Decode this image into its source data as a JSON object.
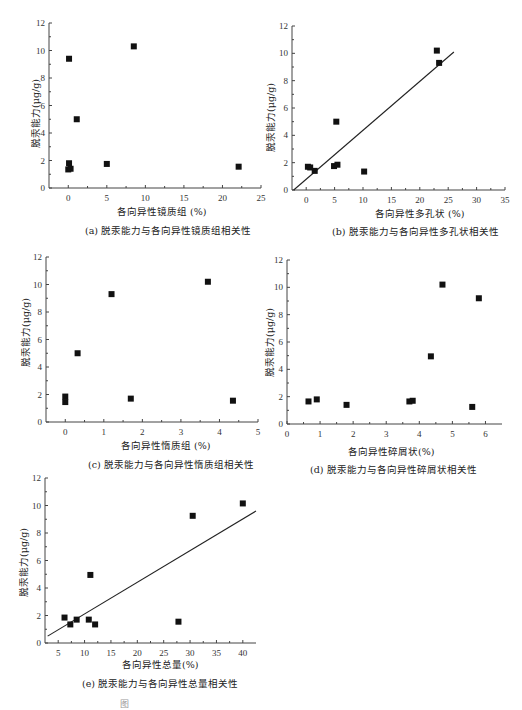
{
  "chart_data": [
    {
      "id": "a",
      "type": "scatter",
      "caption": "(a) 脱汞能力与各向异性镜质组相关性",
      "xlabel": "各向异性镜质组 (%)",
      "ylabel": "脱汞能力(μg/g)",
      "xlim": [
        -2.5,
        25
      ],
      "ylim": [
        0,
        12
      ],
      "xticks": [
        0,
        5,
        10,
        15,
        20,
        25
      ],
      "yticks": [
        0,
        2,
        4,
        6,
        8,
        10,
        12
      ],
      "points": [
        [
          0.1,
          9.4
        ],
        [
          8.5,
          10.3
        ],
        [
          1.1,
          5.0
        ],
        [
          0.1,
          1.8
        ],
        [
          0.0,
          1.35
        ],
        [
          0.3,
          1.4
        ],
        [
          5.0,
          1.75
        ],
        [
          22.1,
          1.55
        ]
      ],
      "fit_line": null
    },
    {
      "id": "b",
      "type": "scatter",
      "caption": "(b) 脱汞能力与各向异性多孔状相关性",
      "xlabel": "各向异性多孔状 (%)",
      "ylabel": "脱汞能力(μg/g)",
      "xlim": [
        -2.5,
        35
      ],
      "ylim": [
        0,
        12
      ],
      "xticks": [
        0,
        5,
        10,
        15,
        20,
        25,
        30,
        35
      ],
      "yticks": [
        0,
        2,
        4,
        6,
        8,
        10,
        12
      ],
      "points": [
        [
          23.0,
          10.2
        ],
        [
          23.4,
          9.3
        ],
        [
          5.3,
          5.0
        ],
        [
          0.3,
          1.7
        ],
        [
          0.7,
          1.65
        ],
        [
          1.5,
          1.4
        ],
        [
          4.9,
          1.75
        ],
        [
          5.5,
          1.85
        ],
        [
          10.2,
          1.35
        ]
      ],
      "fit_line": [
        [
          -2.2,
          0
        ],
        [
          26.0,
          10.1
        ]
      ]
    },
    {
      "id": "c",
      "type": "scatter",
      "caption": "(c) 脱汞能力与各向异性惰质组相关性",
      "xlabel": "各向异性惰质组 (%)",
      "ylabel": "脱汞能力(μg/g)",
      "xlim": [
        -0.5,
        5
      ],
      "ylim": [
        0,
        12
      ],
      "xticks": [
        0,
        1,
        2,
        3,
        4,
        5
      ],
      "yticks": [
        0,
        2,
        4,
        6,
        8,
        10,
        12
      ],
      "points": [
        [
          0.0,
          1.85
        ],
        [
          0.0,
          1.45
        ],
        [
          0.32,
          5.0
        ],
        [
          1.2,
          9.3
        ],
        [
          1.7,
          1.7
        ],
        [
          3.7,
          10.2
        ],
        [
          4.35,
          1.55
        ]
      ],
      "fit_line": null
    },
    {
      "id": "d",
      "type": "scatter",
      "caption": "(d) 脱汞能力与各向异性碎屑状相关性",
      "xlabel": "各向异性碎屑状(%)",
      "ylabel": "脱汞能力(μg/g)",
      "xlim": [
        0,
        6.5
      ],
      "ylim": [
        0,
        12
      ],
      "xticks": [
        0,
        1,
        2,
        3,
        4,
        5,
        6
      ],
      "yticks": [
        0,
        2,
        4,
        6,
        8,
        10,
        12
      ],
      "points": [
        [
          0.65,
          1.65
        ],
        [
          0.9,
          1.8
        ],
        [
          1.8,
          1.4
        ],
        [
          3.7,
          1.65
        ],
        [
          3.8,
          1.7
        ],
        [
          4.35,
          4.95
        ],
        [
          4.7,
          10.2
        ],
        [
          5.6,
          1.25
        ],
        [
          5.8,
          9.2
        ]
      ],
      "fit_line": null
    },
    {
      "id": "e",
      "type": "scatter",
      "caption": "(e) 脱汞能力与各向异性总量相关性",
      "xlabel": "各向异性总量(%)",
      "ylabel": "脱汞能力(μg/g)",
      "xlim": [
        2.5,
        42.5
      ],
      "ylim": [
        0,
        12
      ],
      "xticks": [
        5,
        10,
        15,
        20,
        25,
        30,
        35,
        40
      ],
      "yticks": [
        0,
        2,
        4,
        6,
        8,
        10,
        12
      ],
      "points": [
        [
          6.2,
          1.85
        ],
        [
          7.3,
          1.35
        ],
        [
          8.5,
          1.7
        ],
        [
          10.8,
          1.7
        ],
        [
          11.1,
          4.95
        ],
        [
          12.0,
          1.35
        ],
        [
          27.8,
          1.55
        ],
        [
          30.5,
          9.25
        ],
        [
          40.0,
          10.15
        ]
      ],
      "fit_line": [
        [
          3.0,
          0.5
        ],
        [
          42.5,
          9.6
        ]
      ]
    }
  ],
  "figure": {
    "partial_caption": "图"
  },
  "colors": {
    "marker": "#111111",
    "axis": "#444444",
    "text": "#222222"
  }
}
